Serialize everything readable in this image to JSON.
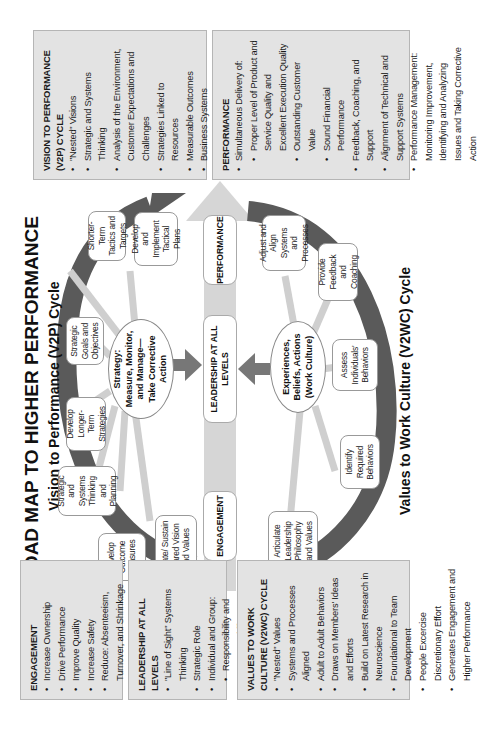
{
  "title": "ROAD MAP TO HIGHER PERFORMANCE",
  "v2p_cycle": {
    "heading": "Vision to Performance (V2P) Cycle",
    "center": "Strategy: Measure, Monitor, and Manage—Take Corrective Action",
    "nodes": [
      "Develop Outcome Measures",
      "Create/ Sustain Shared Vision and Values",
      "Strategic and Systems Thinking and Planning",
      "Develop Longer-Term Strategies",
      "Strategic Goals and Objectives",
      "Shorter-Term Tactics and Targets",
      "Develop and Implement Tactical Plans"
    ]
  },
  "v2wc_cycle": {
    "heading": "Values to Work Culture (V2WC) Cycle",
    "center": "Experiences, Beliefs, Actions (Work Culture)",
    "nodes": [
      "Articulate Leadership Philosophy and Values",
      "Identify Required Behaviors",
      "Assess Individuals' Behaviors",
      "Provide Feedback and Coaching",
      "Adjust and Align Systems and Processes"
    ]
  },
  "center_bar": {
    "stages": [
      "ENGAGEMENT",
      "LEADERSHIP AT ALL LEVELS",
      "PERFORMANCE"
    ]
  },
  "boxes": {
    "engagement": {
      "heading": "ENGAGEMENT",
      "items": [
        "Increase Ownership",
        "Drive Performance",
        "Improve Quality",
        "Increase Safety",
        "Reduce: Absenteeism, Turnover, and Shrinkage"
      ]
    },
    "leadership": {
      "heading": "LEADERSHIP AT ALL LEVELS",
      "items": [
        "\"Line of Sight\" Systems Thinking",
        "Strategic Role",
        "Individual and Group:"
      ],
      "subitems": [
        "Responsibility and Accountability",
        "Performance Improvement",
        "Alignment of the Entire Organization"
      ]
    },
    "v2wc": {
      "heading": "VALUES TO WORK CULTURE (V2WC) CYCLE",
      "items": [
        "\"Nested\" Values",
        "Systems and Processes Aligned",
        "Adult to Adult Behaviors",
        "Draws on Members' Ideas and Efforts",
        "Build on Latest Research in Neuroscience",
        "Foundational to Team Development",
        "People Excercise Discretionary Effort",
        "Generates Engagement and Higher Performance"
      ]
    },
    "v2p": {
      "heading": "VISION TO PERFORMANCE (V2P) CYCLE",
      "items": [
        "\"Nested\" Visions",
        "Strategic and Systems Thinking",
        "Analysis of the Environment, Customer Expectations and Challenges",
        "Strategies Linked to Resources",
        "Measurable Outcomes",
        "Business Systems",
        "Continuous Performance Improvement"
      ]
    },
    "performance": {
      "heading": "PERFORMANCE",
      "items": [
        "Simultaneous Delivery of:"
      ],
      "subitems": [
        "Proper Level of Product and Service Quality and Excellent Execution Quality",
        "Outstanding Customer Value",
        "Sound Financial Performance"
      ],
      "items2": [
        "Feedback, Coaching, and Support",
        "Alignment of Technical and Support Systems",
        "Performance Management: Monitoring Improvement, Identifying and Analyzing Issues and Taking Corrective Action"
      ]
    }
  },
  "colors": {
    "box_fill": "#e3e3e3",
    "dark_arc": "#555555",
    "light_arrow": "#cfcfcf",
    "center_bar": "#d6d6d6"
  }
}
